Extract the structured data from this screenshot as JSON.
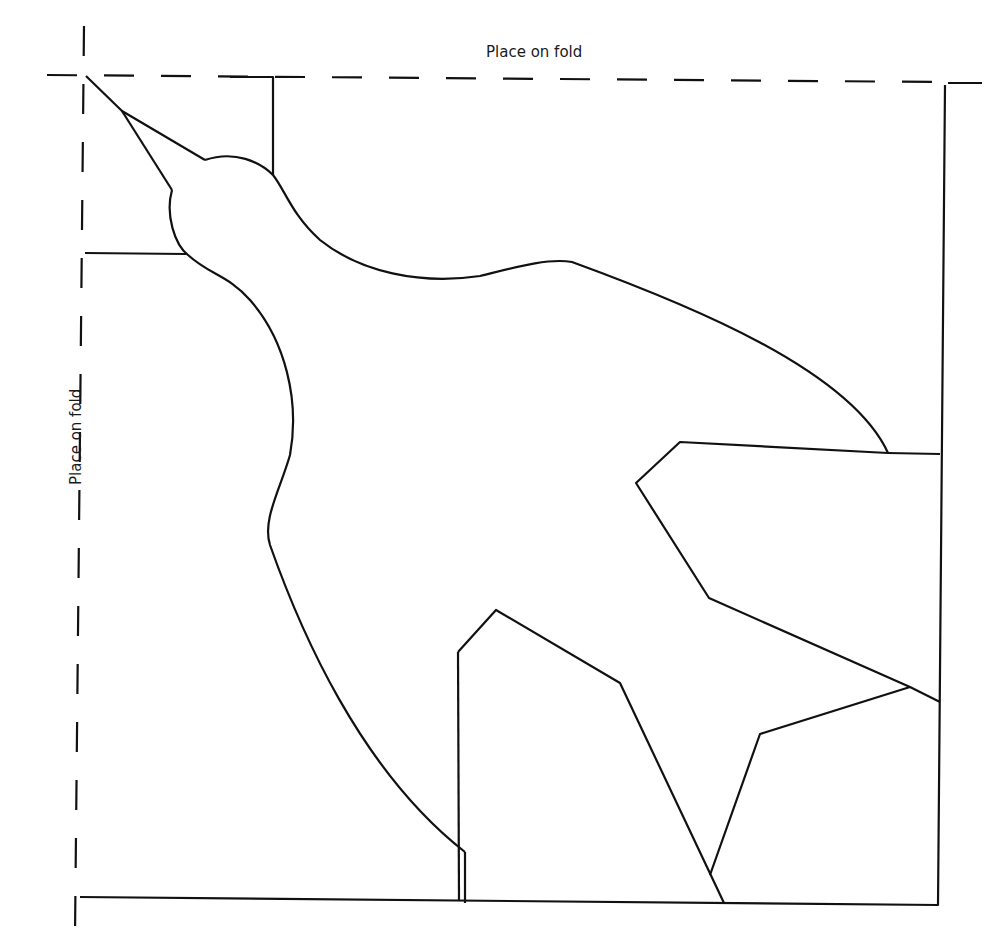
{
  "pattern": {
    "title": "Bird template",
    "labels": {
      "top_fold": "Place on fold",
      "left_fold": "Place on fold"
    },
    "colors": {
      "stroke": "#111111",
      "background": "#ffffff"
    }
  }
}
